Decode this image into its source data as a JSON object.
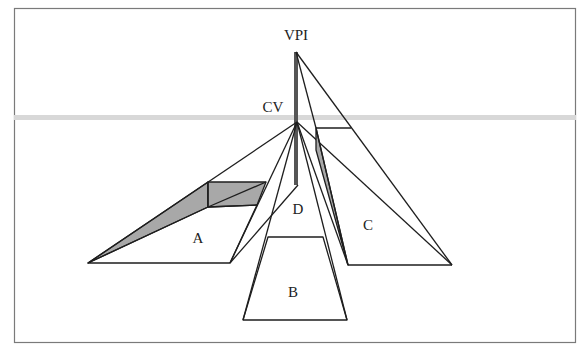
{
  "figure": {
    "type": "perspective-diagram",
    "labels": {
      "vpi": "VPI",
      "cv": "CV",
      "d": "D",
      "a": "A",
      "b": "B",
      "c": "C"
    },
    "colors": {
      "line": "#1e1e1e",
      "shade": "#a8a8a8",
      "horizon": "#d6d6d6",
      "vertical_bar": "#555555",
      "border": "#777777",
      "background": "#ffffff"
    },
    "horizon_label": "horizon line"
  }
}
